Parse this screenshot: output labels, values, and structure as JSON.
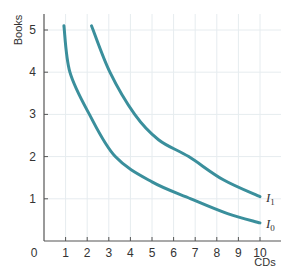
{
  "chart_data": {
    "type": "line",
    "title": "",
    "xlabel": "CDs",
    "ylabel": "Books",
    "xlim": [
      0,
      10
    ],
    "ylim": [
      0,
      5
    ],
    "x_ticks": [
      "0",
      "1",
      "2",
      "3",
      "4",
      "5",
      "6",
      "7",
      "8",
      "9",
      "10"
    ],
    "y_ticks": [
      "1",
      "2",
      "3",
      "4",
      "5"
    ],
    "origin_label": "0",
    "grid": true,
    "legend": "inline labels at curve ends",
    "series": [
      {
        "name": "I0",
        "label_main": "I",
        "label_sub": "0",
        "color": "#3a8f9c",
        "points": [
          [
            0.92,
            5.1
          ],
          [
            1.2,
            4.0
          ],
          [
            2.1,
            3.0
          ],
          [
            3.3,
            2.0
          ],
          [
            5.0,
            1.4
          ],
          [
            6.8,
            1.0
          ],
          [
            8.5,
            0.65
          ],
          [
            10.0,
            0.43
          ]
        ]
      },
      {
        "name": "I1",
        "label_main": "I",
        "label_sub": "1",
        "color": "#3a8f9c",
        "points": [
          [
            2.2,
            5.1
          ],
          [
            3.05,
            4.0
          ],
          [
            4.2,
            3.0
          ],
          [
            5.3,
            2.4
          ],
          [
            6.7,
            2.0
          ],
          [
            8.3,
            1.45
          ],
          [
            10.0,
            1.05
          ]
        ]
      }
    ]
  },
  "layout": {
    "plot": {
      "x0": 44,
      "y0": 241,
      "px_per_x": 21.6,
      "px_per_y": 42.2,
      "x_end": 281,
      "y_top": 14
    },
    "colors": {
      "axis": "#555555",
      "grid": "#e6ecef",
      "curve": "#3a8f9c"
    }
  }
}
